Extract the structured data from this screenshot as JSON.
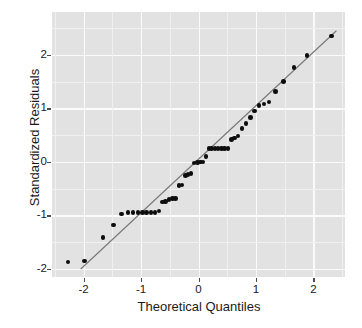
{
  "chart_data": {
    "type": "scatter",
    "title": "",
    "xlabel": "Theoretical Quantiles",
    "ylabel": "Standardized Residuals",
    "xlim": [
      -2.55,
      2.55
    ],
    "ylim": [
      -2.15,
      2.8
    ],
    "xticks": [
      -2,
      -1,
      0,
      1,
      2
    ],
    "xtick_labels": [
      "-2",
      "-1",
      "0",
      "1",
      "2"
    ],
    "yticks": [
      -2,
      -1,
      0,
      1,
      2
    ],
    "ytick_labels": [
      "-2",
      "-1",
      "0",
      "1",
      "2"
    ],
    "grid": true,
    "grid_color": "#fbfbfb",
    "minor_grid_color": "#f0f0f0",
    "panel_background": "#e2e2e2",
    "legend": "none",
    "point_color": "#0d0d0d",
    "point_size": 4.6,
    "reference_line": {
      "label": "qq reference line",
      "color": "#7a7a7a",
      "slope": 1.0,
      "intercept": 0.05,
      "x_start": -2.05,
      "y_start": -2.0,
      "x_end": 2.4,
      "y_end": 2.45
    },
    "x": [
      -2.27,
      -1.98,
      -1.66,
      -1.48,
      -1.34,
      -1.23,
      -1.14,
      -1.05,
      -0.97,
      -0.9,
      -0.83,
      -0.76,
      -0.69,
      -0.63,
      -0.57,
      -0.51,
      -0.45,
      -0.4,
      -0.34,
      -0.29,
      -0.23,
      -0.18,
      -0.13,
      -0.08,
      -0.02,
      0.03,
      0.08,
      0.13,
      0.18,
      0.23,
      0.29,
      0.34,
      0.4,
      0.45,
      0.51,
      0.57,
      0.63,
      0.69,
      0.76,
      0.83,
      0.9,
      0.97,
      1.05,
      1.14,
      1.23,
      1.34,
      1.48,
      1.66,
      1.89,
      2.31
    ],
    "y": [
      -1.87,
      -1.85,
      -1.41,
      -1.18,
      -0.97,
      -0.95,
      -0.95,
      -0.95,
      -0.95,
      -0.94,
      -0.94,
      -0.94,
      -0.92,
      -0.75,
      -0.74,
      -0.7,
      -0.68,
      -0.68,
      -0.44,
      -0.43,
      -0.25,
      -0.24,
      -0.22,
      -0.02,
      -0.01,
      0.0,
      0.0,
      0.1,
      0.25,
      0.25,
      0.25,
      0.25,
      0.25,
      0.25,
      0.25,
      0.42,
      0.45,
      0.48,
      0.62,
      0.72,
      0.83,
      0.95,
      1.05,
      1.08,
      1.12,
      1.32,
      1.5,
      1.76,
      1.99,
      2.35,
      2.61
    ],
    "n_points": 50
  }
}
